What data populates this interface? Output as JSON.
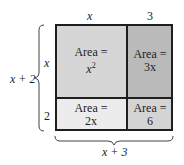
{
  "diagram": {
    "top_labels": {
      "left": "x",
      "right": "3"
    },
    "side_labels": {
      "top": "x",
      "bottom": "2"
    },
    "left_brace_label": "x + 2",
    "bottom_brace_label": "x + 3",
    "cells": [
      {
        "name": "top-left",
        "line1": "Area =",
        "line2": "x",
        "sup": "2",
        "color": "#d6d6d6"
      },
      {
        "name": "top-right",
        "line1": "Area =",
        "line2": "3x",
        "color": "#bababa"
      },
      {
        "name": "bottom-left",
        "line1": "Area =",
        "line2": "2x",
        "color": "#ececec"
      },
      {
        "name": "bottom-right",
        "line1": "Area =",
        "line2": "6",
        "color": "#d4d4d4"
      }
    ]
  }
}
